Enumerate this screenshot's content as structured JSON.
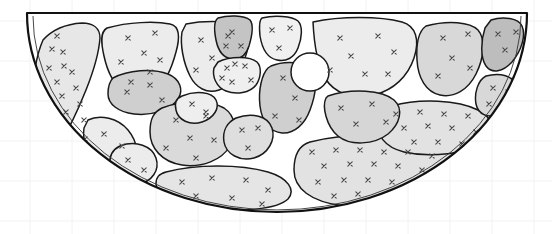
{
  "figure": {
    "title": "",
    "type": "half-disk-cell-partition-diagram",
    "canvas": {
      "width": 552,
      "height": 234
    },
    "background_color": "#ffffff",
    "grid": {
      "visible": true,
      "color": "#f2f2f2",
      "line_width": 1,
      "x_positions": [
        30,
        72,
        114,
        156,
        198,
        240,
        282,
        324,
        366,
        408,
        450,
        492,
        534
      ],
      "y_positions": [
        21,
        61,
        101,
        141,
        181,
        221
      ]
    },
    "boundary": {
      "shape": "half-disk",
      "outline_color": "#111111",
      "outline_width": 2.2,
      "inner_outline_color": "#333333",
      "inner_outline_width": 0.9,
      "top_edge_y": 13,
      "left_x": 27,
      "right_x": 527,
      "bottom_y": 212,
      "center_x": 277,
      "radius_x": 250,
      "radius_y": 199
    },
    "void": {
      "name": "circular-void",
      "cx": 310,
      "cy": 72,
      "r": 19,
      "fill": "#ffffff",
      "stroke": "#1a1a1a",
      "stroke_width": 1.5
    },
    "marker": {
      "glyph": "x",
      "color": "#4a4a4a",
      "size": 4.4,
      "stroke_width": 1.1
    },
    "fill_palette": {
      "lightest": "#efefef",
      "light": "#e7e7e7",
      "medium_light": "#dedede",
      "medium": "#d4d4d4",
      "medium_dark": "#c8c8c8",
      "dark": "#bdbdbd",
      "void": "#ffffff"
    },
    "cell_stroke": {
      "color": "#1a1a1a",
      "width": 1.5
    },
    "cells": [
      {
        "id": "c1",
        "name": "left-crescent",
        "fill": "#e7e7e7",
        "path": "M 43 40 C 52 30 66 24 82 23 C 93 23 100 28 100 38 C 99 52 94 70 86 90 C 78 110 68 131 58 147 C 52 157 45 160 40 154 C 34 146 31 130 31 110 C 32 85 35 58 43 40 Z",
        "markers": [
          [
            57,
            36
          ],
          [
            52,
            49
          ],
          [
            63,
            52
          ],
          [
            64,
            66
          ],
          [
            49,
            68
          ],
          [
            72,
            72
          ],
          [
            57,
            82
          ],
          [
            76,
            88
          ],
          [
            62,
            96
          ],
          [
            80,
            104
          ],
          [
            66,
            112
          ],
          [
            84,
            120
          ],
          [
            70,
            129
          ],
          [
            85,
            139
          ],
          [
            73,
            146
          ]
        ]
      },
      {
        "id": "c2",
        "name": "upper-left-large",
        "fill": "#ececec",
        "path": "M 107 28 C 128 22 155 21 170 24 C 180 26 180 38 176 52 C 172 67 166 82 156 90 C 147 98 134 99 124 92 C 113 84 107 70 104 56 C 101 43 100 32 107 28 Z",
        "markers": [
          [
            128,
            38
          ],
          [
            155,
            33
          ],
          [
            144,
            53
          ],
          [
            121,
            62
          ],
          [
            150,
            72
          ],
          [
            131,
            82
          ],
          [
            160,
            60
          ]
        ]
      },
      {
        "id": "c3",
        "name": "upper-mid-left-large",
        "fill": "#ececec",
        "path": "M 186 24 C 206 20 232 21 243 26 C 251 31 250 44 245 58 C 239 74 231 86 219 90 C 207 94 196 88 190 76 C 183 62 180 44 182 32 Z",
        "markers": [
          [
            201,
            40
          ],
          [
            228,
            36
          ],
          [
            212,
            58
          ],
          [
            235,
            64
          ],
          [
            196,
            70
          ],
          [
            222,
            78
          ]
        ]
      },
      {
        "id": "c4",
        "name": "top-dark-small",
        "fill": "#c4c4c4",
        "path": "M 218 18 C 228 15 244 15 250 20 C 254 25 252 36 249 46 C 246 55 240 60 232 59 C 223 58 218 50 216 40 C 214 30 214 21 218 18 Z",
        "markers": [
          [
            232,
            32
          ],
          [
            226,
            46
          ],
          [
            241,
            46
          ]
        ]
      },
      {
        "id": "c5",
        "name": "top-center-light",
        "fill": "#f0f0f0",
        "path": "M 262 18 C 274 15 292 16 298 21 C 303 26 302 38 298 48 C 294 58 286 62 277 60 C 267 58 262 48 260 36 C 259 26 259 20 262 18 Z",
        "markers": [
          [
            272,
            30
          ],
          [
            290,
            28
          ],
          [
            279,
            48
          ]
        ]
      },
      {
        "id": "c6",
        "name": "top-right-wide-light",
        "fill": "#ececec",
        "path": "M 313 22 C 340 16 380 16 402 22 C 416 26 420 40 414 58 C 408 76 394 90 374 95 C 352 100 334 93 325 78 C 317 64 314 42 313 22 Z",
        "markers": [
          [
            340,
            38
          ],
          [
            378,
            36
          ],
          [
            351,
            56
          ],
          [
            365,
            74
          ],
          [
            330,
            70
          ],
          [
            394,
            52
          ],
          [
            388,
            74
          ]
        ]
      },
      {
        "id": "c7",
        "name": "right-mid-large",
        "fill": "#d8d8d8",
        "path": "M 426 26 C 448 20 470 22 478 30 C 486 39 484 58 476 74 C 468 90 454 98 440 95 C 426 92 418 78 417 60 C 416 44 419 31 426 26 Z",
        "markers": [
          [
            443,
            38
          ],
          [
            468,
            34
          ],
          [
            452,
            58
          ],
          [
            438,
            76
          ],
          [
            470,
            68
          ]
        ]
      },
      {
        "id": "c8",
        "name": "far-right-dark",
        "fill": "#bdbdbd",
        "path": "M 491 20 C 503 16 518 18 522 26 C 526 35 522 50 512 62 C 503 72 492 74 486 66 C 480 57 481 40 485 28 Z",
        "markers": [
          [
            498,
            34
          ],
          [
            516,
            32
          ],
          [
            505,
            50
          ]
        ]
      },
      {
        "id": "c9",
        "name": "mid-left-dark-lens",
        "fill": "#cfcfcf",
        "path": "M 113 78 C 128 70 152 68 168 74 C 180 79 184 90 178 99 C 171 110 152 116 134 114 C 118 112 108 104 108 94 C 108 86 110 81 113 78 Z",
        "markers": [
          [
            127,
            92
          ],
          [
            150,
            85
          ],
          [
            162,
            100
          ]
        ]
      },
      {
        "id": "c10",
        "name": "center-small-light-upper",
        "fill": "#efefef",
        "path": "M 218 62 C 230 56 250 56 257 62 C 262 67 261 78 256 85 C 250 93 236 95 226 91 C 216 87 212 76 214 68 Z",
        "markers": [
          [
            227,
            68
          ],
          [
            245,
            66
          ],
          [
            232,
            82
          ],
          [
            251,
            80
          ]
        ]
      },
      {
        "id": "c11",
        "name": "center-tall-medium",
        "fill": "#cfcfcf",
        "path": "M 271 66 C 286 60 305 62 312 70 C 318 78 316 94 310 110 C 305 124 294 134 282 133 C 270 132 262 122 260 106 C 258 90 262 74 268 68 Z",
        "markers": [
          [
            283,
            78
          ],
          [
            295,
            98
          ],
          [
            275,
            116
          ],
          [
            299,
            120
          ]
        ]
      },
      {
        "id": "c12",
        "name": "center-left-medium-large",
        "fill": "#dadada",
        "path": "M 162 108 C 182 100 210 100 224 108 C 236 116 238 132 230 146 C 222 160 202 168 182 165 C 162 162 150 148 150 132 C 150 118 154 112 162 108 Z",
        "markers": [
          [
            176,
            120
          ],
          [
            206,
            116
          ],
          [
            190,
            138
          ],
          [
            166,
            148
          ],
          [
            214,
            140
          ],
          [
            196,
            158
          ]
        ]
      },
      {
        "id": "c13",
        "name": "lower-left-crescent",
        "fill": "#ececec",
        "path": "M 88 120 C 100 114 118 118 128 130 C 138 142 140 158 132 168 C 124 178 108 178 98 168 C 88 158 82 140 84 128 Z",
        "markers": [
          [
            104,
            134
          ],
          [
            122,
            146
          ],
          [
            108,
            162
          ]
        ]
      },
      {
        "id": "c14",
        "name": "bottom-center-wide",
        "fill": "#e5e5e5",
        "path": "M 166 172 C 196 164 240 164 268 172 C 288 178 296 190 288 199 C 278 209 240 213 202 208 C 172 204 156 194 156 184 C 156 177 159 174 166 172 Z",
        "markers": [
          [
            182,
            182
          ],
          [
            212,
            178
          ],
          [
            246,
            180
          ],
          [
            196,
            196
          ],
          [
            232,
            198
          ],
          [
            268,
            190
          ],
          [
            262,
            204
          ]
        ]
      },
      {
        "id": "c15",
        "name": "bottom-right-large-stipple",
        "fill": "#e2e2e2",
        "path": "M 310 142 C 350 132 410 134 446 146 C 470 154 478 170 462 184 C 442 200 390 210 344 206 C 310 202 294 188 294 170 C 294 154 300 145 310 142 Z",
        "markers": [
          [
            312,
            152
          ],
          [
            336,
            150
          ],
          [
            360,
            150
          ],
          [
            384,
            152
          ],
          [
            408,
            152
          ],
          [
            432,
            156
          ],
          [
            324,
            166
          ],
          [
            350,
            164
          ],
          [
            374,
            164
          ],
          [
            398,
            166
          ],
          [
            422,
            170
          ],
          [
            446,
            170
          ],
          [
            318,
            182
          ],
          [
            344,
            180
          ],
          [
            368,
            180
          ],
          [
            392,
            182
          ],
          [
            416,
            186
          ],
          [
            438,
            186
          ],
          [
            334,
            196
          ],
          [
            358,
            194
          ],
          [
            382,
            196
          ],
          [
            406,
            198
          ]
        ]
      },
      {
        "id": "c16",
        "name": "right-mid-stipple-band",
        "fill": "#e2e2e2",
        "path": "M 392 106 C 420 98 458 100 478 110 C 494 118 496 132 484 142 C 468 154 430 158 404 152 C 384 147 376 134 378 122 C 380 113 385 108 392 106 Z",
        "markers": [
          [
            396,
            114
          ],
          [
            420,
            112
          ],
          [
            444,
            114
          ],
          [
            468,
            116
          ],
          [
            404,
            128
          ],
          [
            428,
            126
          ],
          [
            452,
            128
          ],
          [
            476,
            132
          ],
          [
            414,
            142
          ],
          [
            438,
            142
          ],
          [
            462,
            144
          ]
        ]
      },
      {
        "id": "c17",
        "name": "right-edge-small-upper",
        "fill": "#d8d8d8",
        "path": "M 486 76 C 500 72 514 76 516 86 C 518 96 510 108 498 114 C 488 119 478 114 476 104 C 474 93 478 80 486 76 Z",
        "markers": [
          [
            493,
            88
          ],
          [
            508,
            92
          ],
          [
            489,
            104
          ]
        ]
      },
      {
        "id": "c18",
        "name": "center-right-medium",
        "fill": "#d6d6d6",
        "path": "M 328 96 C 352 88 382 90 394 100 C 404 109 400 124 388 134 C 374 145 350 146 338 136 C 326 126 322 106 326 98 Z",
        "markers": [
          [
            341,
            108
          ],
          [
            372,
            104
          ],
          [
            356,
            124
          ],
          [
            386,
            122
          ]
        ]
      },
      {
        "id": "c19",
        "name": "mid-upper-small-left",
        "fill": "#eeeeee",
        "path": "M 182 96 C 196 90 212 92 216 100 C 220 108 214 118 202 122 C 190 126 178 120 176 110 C 174 102 177 98 182 96 Z",
        "markers": [
          [
            192,
            104
          ],
          [
            206,
            112
          ]
        ]
      },
      {
        "id": "c20",
        "name": "bottom-left-small",
        "fill": "#ececec",
        "path": "M 120 146 C 136 140 152 146 156 158 C 160 170 152 182 138 184 C 124 186 112 176 110 164 C 109 154 114 149 120 146 Z",
        "markers": [
          [
            128,
            160
          ],
          [
            144,
            170
          ]
        ]
      },
      {
        "id": "c21",
        "name": "mid-right-between",
        "fill": "#dedede",
        "path": "M 236 118 C 252 112 268 116 272 128 C 276 140 268 154 254 158 C 240 162 226 154 224 142 C 222 130 228 122 236 118 Z",
        "markers": [
          [
            242,
            130
          ],
          [
            258,
            128
          ],
          [
            248,
            148
          ]
        ]
      }
    ]
  }
}
